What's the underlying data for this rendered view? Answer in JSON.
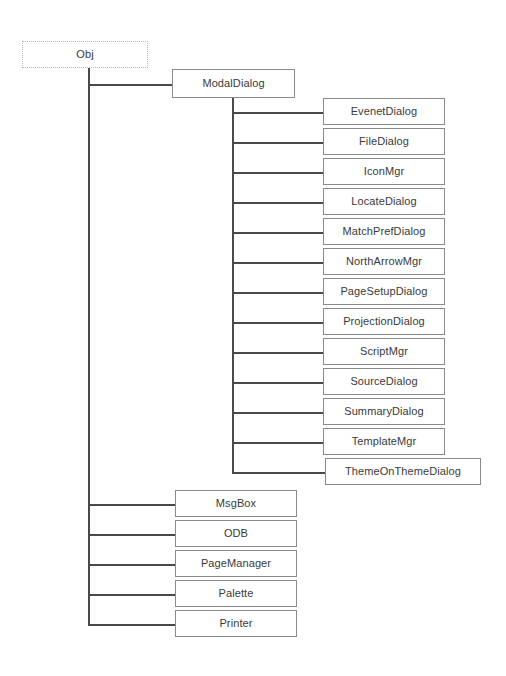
{
  "diagram": {
    "background_color": "#ffffff",
    "box_border_color": "#8a8a8a",
    "root_border_color": "#b9b9b9",
    "connector_color": "#4a4a4a",
    "text_color": "#3a3a3a"
  },
  "root": {
    "label": "Obj",
    "style": "dotted",
    "x": 22,
    "y": 41,
    "w": 126,
    "h": 27
  },
  "modal_dialog": {
    "label": "ModalDialog",
    "x": 172,
    "y": 69,
    "w": 123,
    "h": 29
  },
  "modal_dialog_children": [
    {
      "label": "EvenetDialog",
      "x": 323,
      "y": 98,
      "w": 122,
      "h": 27
    },
    {
      "label": "FileDialog",
      "x": 323,
      "y": 128,
      "w": 122,
      "h": 27
    },
    {
      "label": "IconMgr",
      "x": 323,
      "y": 158,
      "w": 122,
      "h": 27
    },
    {
      "label": "LocateDialog",
      "x": 323,
      "y": 188,
      "w": 122,
      "h": 27
    },
    {
      "label": "MatchPrefDialog",
      "x": 323,
      "y": 218,
      "w": 122,
      "h": 27
    },
    {
      "label": "NorthArrowMgr",
      "x": 323,
      "y": 248,
      "w": 122,
      "h": 27
    },
    {
      "label": "PageSetupDialog",
      "x": 323,
      "y": 278,
      "w": 122,
      "h": 27
    },
    {
      "label": "ProjectionDialog",
      "x": 323,
      "y": 308,
      "w": 122,
      "h": 27
    },
    {
      "label": "ScriptMgr",
      "x": 323,
      "y": 338,
      "w": 122,
      "h": 27
    },
    {
      "label": "SourceDialog",
      "x": 323,
      "y": 368,
      "w": 122,
      "h": 27
    },
    {
      "label": "SummaryDialog",
      "x": 323,
      "y": 398,
      "w": 122,
      "h": 27
    },
    {
      "label": "TemplateMgr",
      "x": 323,
      "y": 428,
      "w": 122,
      "h": 27
    },
    {
      "label": "ThemeOnThemeDialog",
      "x": 325,
      "y": 458,
      "w": 156,
      "h": 27
    }
  ],
  "obj_children": [
    {
      "label": "MsgBox",
      "x": 175,
      "y": 490,
      "w": 122,
      "h": 27
    },
    {
      "label": "ODB",
      "x": 175,
      "y": 520,
      "w": 122,
      "h": 27
    },
    {
      "label": "PageManager",
      "x": 175,
      "y": 550,
      "w": 122,
      "h": 27
    },
    {
      "label": "Palette",
      "x": 175,
      "y": 580,
      "w": 122,
      "h": 27
    },
    {
      "label": "Printer",
      "x": 175,
      "y": 610,
      "w": 122,
      "h": 27
    }
  ],
  "connectors": {
    "obj_stem_x": 88,
    "obj_stem_top": 68,
    "obj_stem_bottom": 624,
    "obj_to_modal_y": 84,
    "modal_stem_x": 232,
    "modal_stem_top": 98,
    "modal_stem_bottom": 472
  }
}
